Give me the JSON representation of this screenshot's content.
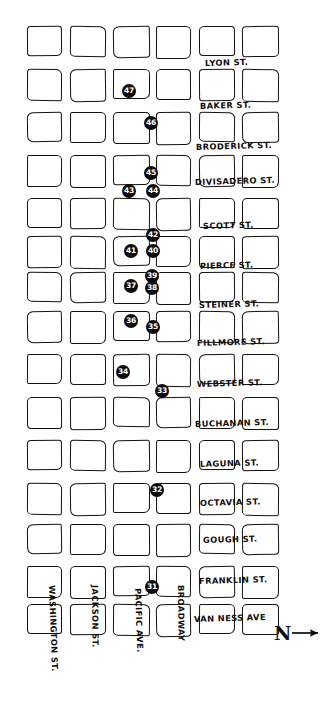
{
  "map": {
    "title": "San Francisco street grid sketch map",
    "grid": {
      "columns": 6,
      "rows": 15,
      "col_x": [
        27,
        70,
        113,
        156,
        199,
        242
      ],
      "row_y": [
        26,
        69,
        112,
        155,
        198,
        236,
        272,
        311,
        354,
        397,
        440,
        483,
        524,
        566,
        604
      ],
      "block_w": 36,
      "block_h": 31
    },
    "horizontal_streets": [
      {
        "label": "LYON ST.",
        "x": 205,
        "y": 58
      },
      {
        "label": "BAKER ST.",
        "x": 200,
        "y": 101
      },
      {
        "label": "BRODERICK ST.",
        "x": 196,
        "y": 142
      },
      {
        "label": "DIVISADERO ST.",
        "x": 195,
        "y": 177
      },
      {
        "label": "SCOTT ST.",
        "x": 203,
        "y": 221
      },
      {
        "label": "PIERCE ST.",
        "x": 200,
        "y": 261
      },
      {
        "label": "STEINER ST.",
        "x": 199,
        "y": 300
      },
      {
        "label": "FILLMORE ST.",
        "x": 197,
        "y": 338
      },
      {
        "label": "WEBSTER ST.",
        "x": 197,
        "y": 379
      },
      {
        "label": "BUCHANAN ST.",
        "x": 195,
        "y": 419
      },
      {
        "label": "LAGUNA ST.",
        "x": 200,
        "y": 459
      },
      {
        "label": "OCTAVIA ST.",
        "x": 200,
        "y": 498
      },
      {
        "label": "GOUGH ST.",
        "x": 203,
        "y": 535
      },
      {
        "label": "FRANKLIN ST.",
        "x": 199,
        "y": 576
      },
      {
        "label": "VAN NESS AVE",
        "x": 194,
        "y": 614
      }
    ],
    "vertical_streets": [
      {
        "label": "WASHINGTON ST.",
        "x": 57,
        "y": 585
      },
      {
        "label": "JACKSON ST.",
        "x": 100,
        "y": 585
      },
      {
        "label": "PACIFIC AVE.",
        "x": 143,
        "y": 588
      },
      {
        "label": "BROADWAY",
        "x": 186,
        "y": 585
      }
    ],
    "markers": [
      {
        "number": "47",
        "x": 122,
        "y": 84
      },
      {
        "number": "46",
        "x": 144,
        "y": 116
      },
      {
        "number": "45",
        "x": 144,
        "y": 166
      },
      {
        "number": "43",
        "x": 122,
        "y": 184
      },
      {
        "number": "44",
        "x": 146,
        "y": 184
      },
      {
        "number": "42",
        "x": 146,
        "y": 228
      },
      {
        "number": "41",
        "x": 124,
        "y": 244
      },
      {
        "number": "40",
        "x": 146,
        "y": 244
      },
      {
        "number": "39",
        "x": 145,
        "y": 269
      },
      {
        "number": "37",
        "x": 124,
        "y": 279
      },
      {
        "number": "38",
        "x": 145,
        "y": 281
      },
      {
        "number": "36",
        "x": 124,
        "y": 314
      },
      {
        "number": "35",
        "x": 146,
        "y": 320
      },
      {
        "number": "34",
        "x": 116,
        "y": 365
      },
      {
        "number": "33",
        "x": 155,
        "y": 384
      },
      {
        "number": "32",
        "x": 150,
        "y": 483
      },
      {
        "number": "31",
        "x": 145,
        "y": 580
      }
    ],
    "compass": {
      "label": "N",
      "direction": "east-arrow"
    },
    "colors": {
      "ink": "#15110f",
      "marker_fill": "#0d0b0a",
      "marker_text": "#ffffff",
      "paper": "#ffffff"
    }
  }
}
